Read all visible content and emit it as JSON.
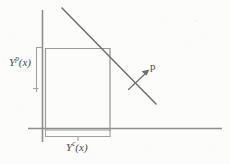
{
  "figure": {
    "background_color": "#fcfcfb",
    "ink_color": "#8a8a8a",
    "label_color": "#4a4a4a",
    "labels": {
      "y_axis_label": {
        "base": "Y",
        "superscript": "p",
        "argument": "(x)",
        "full_text": "Yᵖ(x)"
      },
      "x_axis_label": {
        "base": "Y",
        "superscript": "c",
        "argument": "(x)",
        "full_text": "Yᶜ(x)"
      },
      "price_vector_label": {
        "full_text": "p"
      }
    },
    "geometry": {
      "vertical_axis": {
        "x": 42,
        "y_top": 10,
        "y_bottom": 142
      },
      "horizontal_axis": {
        "y": 128,
        "x_left": 28,
        "x_right": 222
      },
      "rectangle": {
        "x_left": 45,
        "y_top": 48,
        "x_right": 110,
        "y_bottom": 129
      },
      "price_line": {
        "x1": 62,
        "y1": 8,
        "x2": 156,
        "y2": 104
      },
      "price_arrow": {
        "x1": 129,
        "y1": 89,
        "x2": 148,
        "y2": 71
      },
      "left_brace": {
        "x": 36,
        "y_top": 47,
        "y_bottom": 92,
        "tick_y": 88
      },
      "bottom_brace": {
        "y": 136,
        "x_left": 45,
        "x_right": 110,
        "tick_x": 78
      }
    }
  }
}
